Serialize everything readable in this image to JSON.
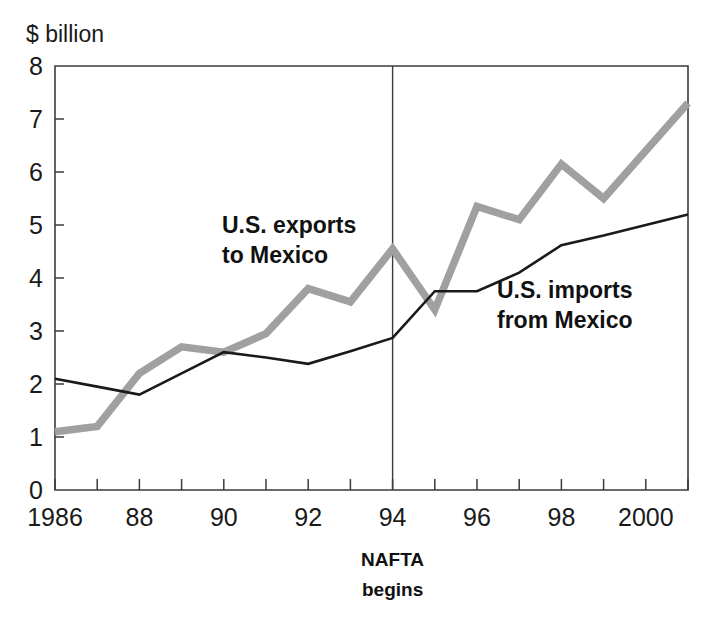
{
  "chart_data": {
    "type": "line",
    "title": "",
    "xlabel": "",
    "ylabel": "$ billion",
    "ylim": [
      0,
      8
    ],
    "xlim": [
      1986,
      2001
    ],
    "grid": false,
    "legend_position": "inline-annotation",
    "x": [
      1986,
      1987,
      1988,
      1989,
      1990,
      1991,
      1992,
      1993,
      1994,
      1995,
      1996,
      1997,
      1998,
      1999,
      2000,
      2001
    ],
    "y_ticks": [
      "0",
      "1",
      "2",
      "3",
      "4",
      "5",
      "6",
      "7",
      "8"
    ],
    "x_tick_labels": [
      "1986",
      "88",
      "90",
      "92",
      "94",
      "96",
      "98",
      "2000"
    ],
    "x_tick_label_years": [
      1986,
      1988,
      1990,
      1992,
      1994,
      1996,
      1998,
      2000
    ],
    "series": [
      {
        "name": "U.S. exports to Mexico",
        "color": "#a0a0a0",
        "values": [
          1.1,
          1.2,
          2.2,
          2.7,
          2.6,
          2.95,
          3.8,
          3.55,
          4.55,
          3.4,
          5.35,
          5.1,
          6.15,
          5.5,
          6.4,
          7.3
        ]
      },
      {
        "name": "U.S. imports from Mexico",
        "color": "#1a1a1a",
        "values": [
          2.1,
          1.95,
          1.8,
          2.2,
          2.6,
          2.5,
          2.38,
          2.62,
          2.87,
          3.75,
          3.75,
          4.1,
          4.62,
          4.8,
          5.0,
          5.2
        ]
      }
    ],
    "annotations": [
      {
        "id": "exports-label",
        "lines": [
          "U.S. exports",
          "to Mexico"
        ],
        "x_px": 222,
        "y_px": 233
      },
      {
        "id": "imports-label",
        "lines": [
          "U.S. imports",
          "from Mexico"
        ],
        "x_px": 497,
        "y_px": 298
      }
    ],
    "event_marker": {
      "year": 1994,
      "lines": [
        "NAFTA",
        "begins"
      ]
    }
  },
  "axis": {
    "unit_label": "$ billion"
  },
  "event": {
    "line1": "NAFTA",
    "line2": "begins"
  },
  "colors": {
    "exports_series": "#a0a0a0",
    "imports_series": "#1a1a1a",
    "axis": "#3b3b3b",
    "background": "#ffffff"
  }
}
